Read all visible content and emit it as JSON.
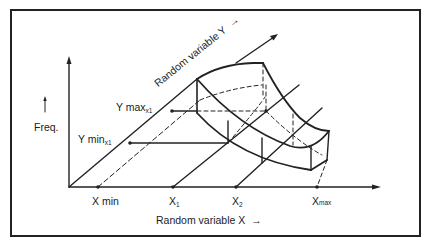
{
  "diagram": {
    "type": "3d-probability-surface-sketch",
    "axes": {
      "frequency": {
        "label": "Freq.",
        "arrow": "up"
      },
      "x": {
        "label": "Random variable  X",
        "arrow": "right",
        "ticks": [
          "X min",
          "X",
          "X",
          "X"
        ],
        "tick_subscripts": [
          "",
          "1",
          "2",
          "max"
        ]
      },
      "y": {
        "label": "Random variable  Y",
        "arrow": "diagonal-up-right"
      }
    },
    "markers": {
      "y_max": {
        "label": "Y max",
        "subscript": "x1"
      },
      "y_min": {
        "label": "Y min",
        "subscript": "x1"
      }
    },
    "arrow_glyph": "→",
    "colors": {
      "ink": "#222222",
      "background": "#ffffff"
    }
  }
}
